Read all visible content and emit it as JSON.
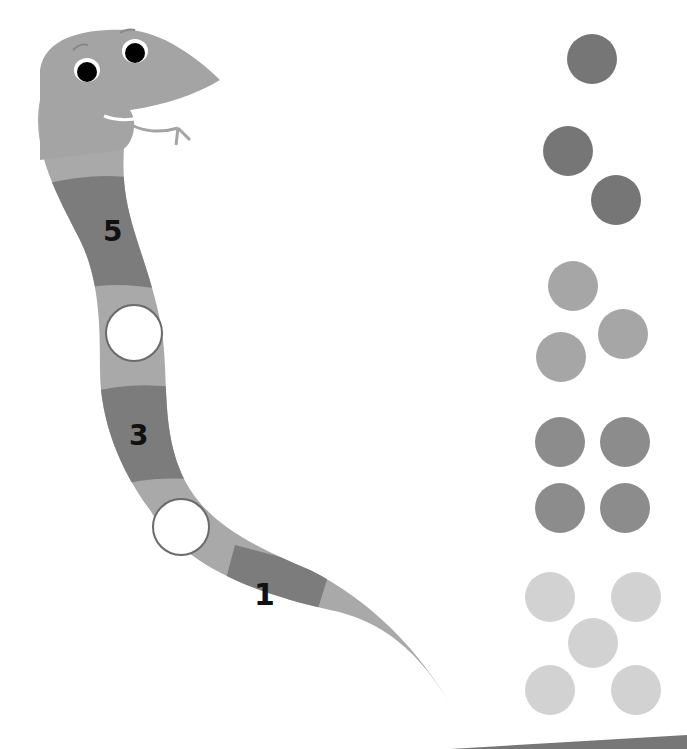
{
  "worksheet": {
    "title": "Snake counting activity",
    "snake": {
      "body_colors": {
        "light": "#a9a9a9",
        "dark": "#7c7c7c",
        "head": "#a4a4a4"
      },
      "segments": [
        {
          "type": "label",
          "value": "5"
        },
        {
          "type": "blank",
          "value": ""
        },
        {
          "type": "label",
          "value": "3"
        },
        {
          "type": "blank",
          "value": ""
        },
        {
          "type": "label",
          "value": "1"
        }
      ]
    },
    "dot_groups": [
      {
        "count": 1,
        "color": "#767676"
      },
      {
        "count": 2,
        "color": "#767676"
      },
      {
        "count": 3,
        "color": "#a6a6a6"
      },
      {
        "count": 4,
        "color": "#8c8c8c"
      },
      {
        "count": 5,
        "color": "#d2d2d2"
      }
    ]
  }
}
